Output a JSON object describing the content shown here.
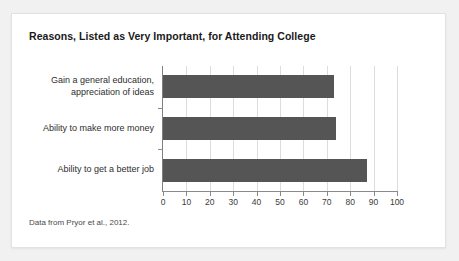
{
  "card": {
    "title": "Reasons, Listed as Very Important, for Attending College",
    "source_note": "Data from Pryor et al., 2012."
  },
  "chart_data": {
    "type": "bar",
    "orientation": "horizontal",
    "title": "Reasons, Listed as Very Important, for Attending College",
    "categories": [
      "Gain a general education,\nappreciation of ideas",
      "Ability to make more money",
      "Ability to get a better job"
    ],
    "values": [
      73,
      74,
      87
    ],
    "xlabel": "",
    "ylabel": "",
    "xlim": [
      0,
      100
    ],
    "xticks": [
      0,
      10,
      20,
      30,
      40,
      50,
      60,
      70,
      80,
      90,
      100
    ],
    "xtick_labels": [
      "0",
      "10",
      "20",
      "30",
      "40",
      "50",
      "60",
      "70",
      "80",
      "90",
      "100"
    ],
    "grid": "vertical",
    "legend": "none",
    "bar_color": "#555555",
    "gridline_color": "#dcdcdc",
    "axis_color": "#8a8a8a",
    "annotation": "Data from Pryor et al., 2012."
  }
}
